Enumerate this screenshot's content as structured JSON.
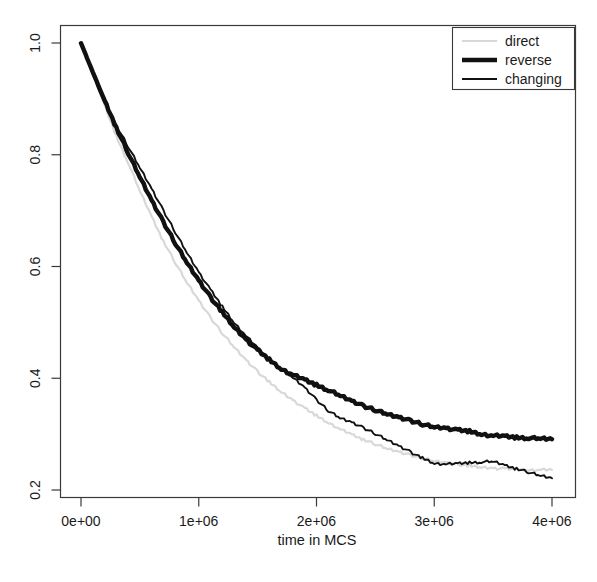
{
  "chart_data": {
    "type": "line",
    "title": "",
    "xlabel": "time in MCS",
    "ylabel": "",
    "xlim": [
      0,
      4000000
    ],
    "ylim": [
      0.2,
      1.0
    ],
    "grid": false,
    "legend_position": "top-right",
    "xticks": [
      0,
      1000000,
      2000000,
      3000000,
      4000000
    ],
    "xticklabels": [
      "0e+00",
      "1e+06",
      "2e+06",
      "3e+06",
      "4e+06"
    ],
    "yticks": [
      0.2,
      0.4,
      0.6,
      0.8,
      1.0
    ],
    "yticklabels": [
      "0.2",
      "0.4",
      "0.6",
      "0.8",
      "1.0"
    ],
    "series": [
      {
        "name": "direct",
        "color": "#d8d8d8",
        "linewidth": 2.2,
        "x": [
          0,
          100000,
          200000,
          300000,
          400000,
          500000,
          600000,
          700000,
          800000,
          900000,
          1000000,
          1100000,
          1200000,
          1300000,
          1400000,
          1500000,
          1600000,
          1700000,
          1800000,
          1900000,
          2000000,
          2100000,
          2200000,
          2300000,
          2400000,
          2500000,
          2600000,
          2700000,
          2800000,
          2900000,
          3000000,
          3100000,
          3200000,
          3300000,
          3400000,
          3500000,
          3600000,
          3700000,
          3800000,
          3900000,
          4000000
        ],
        "y": [
          1.0,
          0.945,
          0.888,
          0.833,
          0.786,
          0.735,
          0.689,
          0.645,
          0.607,
          0.571,
          0.539,
          0.508,
          0.481,
          0.456,
          0.433,
          0.412,
          0.393,
          0.376,
          0.361,
          0.346,
          0.333,
          0.321,
          0.309,
          0.299,
          0.29,
          0.282,
          0.274,
          0.268,
          0.262,
          0.257,
          0.252,
          0.249,
          0.246,
          0.243,
          0.241,
          0.239,
          0.238,
          0.237,
          0.236,
          0.236,
          0.236
        ]
      },
      {
        "name": "reverse",
        "color": "#111111",
        "linewidth": 4.4,
        "x": [
          0,
          100000,
          200000,
          300000,
          400000,
          500000,
          600000,
          700000,
          800000,
          900000,
          1000000,
          1100000,
          1200000,
          1300000,
          1400000,
          1500000,
          1600000,
          1700000,
          1800000,
          1900000,
          2000000,
          2100000,
          2200000,
          2300000,
          2400000,
          2500000,
          2600000,
          2700000,
          2800000,
          2900000,
          3000000,
          3100000,
          3200000,
          3300000,
          3400000,
          3500000,
          3600000,
          3700000,
          3800000,
          3900000,
          4000000
        ],
        "y": [
          1.0,
          0.948,
          0.897,
          0.848,
          0.803,
          0.76,
          0.718,
          0.679,
          0.642,
          0.607,
          0.575,
          0.545,
          0.518,
          0.492,
          0.47,
          0.45,
          0.433,
          0.417,
          0.406,
          0.397,
          0.388,
          0.379,
          0.369,
          0.359,
          0.35,
          0.343,
          0.336,
          0.33,
          0.324,
          0.318,
          0.313,
          0.311,
          0.307,
          0.305,
          0.3,
          0.297,
          0.296,
          0.294,
          0.293,
          0.292,
          0.291
        ]
      },
      {
        "name": "changing",
        "color": "#111111",
        "linewidth": 1.9,
        "x": [
          0,
          100000,
          200000,
          300000,
          400000,
          500000,
          600000,
          700000,
          800000,
          900000,
          1000000,
          1100000,
          1200000,
          1300000,
          1400000,
          1500000,
          1600000,
          1700000,
          1800000,
          1900000,
          2000000,
          2100000,
          2200000,
          2300000,
          2400000,
          2500000,
          2600000,
          2700000,
          2800000,
          2900000,
          3000000,
          3100000,
          3200000,
          3300000,
          3400000,
          3500000,
          3600000,
          3700000,
          3800000,
          3900000,
          4000000
        ],
        "y": [
          1.0,
          0.944,
          0.892,
          0.852,
          0.815,
          0.777,
          0.739,
          0.7,
          0.662,
          0.625,
          0.59,
          0.558,
          0.528,
          0.5,
          0.476,
          0.454,
          0.435,
          0.418,
          0.401,
          0.383,
          0.361,
          0.342,
          0.329,
          0.321,
          0.311,
          0.301,
          0.29,
          0.279,
          0.268,
          0.257,
          0.248,
          0.246,
          0.247,
          0.249,
          0.25,
          0.251,
          0.244,
          0.238,
          0.232,
          0.226,
          0.221
        ]
      }
    ]
  },
  "legend": {
    "entries": [
      {
        "label": "direct"
      },
      {
        "label": "reverse"
      },
      {
        "label": "changing"
      }
    ]
  },
  "axes": {
    "x_title": "time in MCS"
  }
}
